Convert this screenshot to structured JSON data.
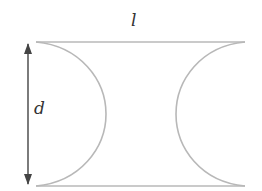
{
  "diagram": {
    "labels": {
      "length": "l",
      "diameter": "d"
    },
    "colors": {
      "outline": "#b8b8b8",
      "arrow": "#444444",
      "text": "#333333"
    },
    "geometry": {
      "top_line": {
        "x1": 36,
        "y1": 42,
        "x2": 245,
        "y2": 42
      },
      "bottom_line": {
        "x1": 36,
        "y1": 186,
        "x2": 245,
        "y2": 186
      },
      "left_arc": {
        "start": [
          36,
          42
        ],
        "peak": [
          106,
          114
        ],
        "end": [
          36,
          186
        ]
      },
      "right_arc": {
        "start": [
          245,
          42
        ],
        "peak": [
          176,
          114
        ],
        "end": [
          245,
          186
        ]
      },
      "dimension_arrow": {
        "x": 28,
        "y1": 42,
        "y2": 186
      }
    }
  }
}
